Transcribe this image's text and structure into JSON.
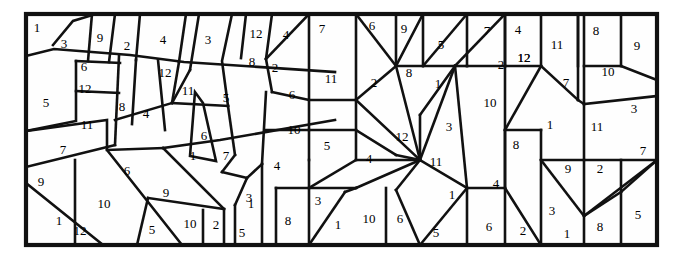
{
  "figure": {
    "name": "numbered-polygon-dissection",
    "background_color": "#ffffff",
    "line_color": "#111111",
    "fill_color": "#fefefe",
    "border": {
      "x": 26,
      "y": 14,
      "width": 631,
      "height": 231
    }
  },
  "cells": [
    {
      "id": "c01",
      "label": "1",
      "x": 37,
      "y": 29
    },
    {
      "id": "c02",
      "label": "3",
      "x": 64,
      "y": 45
    },
    {
      "id": "c03",
      "label": "9",
      "x": 100,
      "y": 39
    },
    {
      "id": "c04",
      "label": "2",
      "x": 127,
      "y": 47
    },
    {
      "id": "c05",
      "label": "4",
      "x": 163,
      "y": 41
    },
    {
      "id": "c06",
      "label": "3",
      "x": 208,
      "y": 41
    },
    {
      "id": "c07",
      "label": "12",
      "x": 256,
      "y": 35
    },
    {
      "id": "c08",
      "label": "4",
      "x": 286,
      "y": 36
    },
    {
      "id": "c09",
      "label": "7",
      "x": 322,
      "y": 30
    },
    {
      "id": "c10",
      "label": "6",
      "x": 372,
      "y": 27
    },
    {
      "id": "c11",
      "label": "9",
      "x": 404,
      "y": 30
    },
    {
      "id": "c12",
      "label": "5",
      "x": 441,
      "y": 46
    },
    {
      "id": "c13",
      "label": "7",
      "x": 487,
      "y": 32
    },
    {
      "id": "c14",
      "label": "4",
      "x": 518,
      "y": 31
    },
    {
      "id": "c15",
      "label": "12",
      "x": 524,
      "y": 59
    },
    {
      "id": "c16",
      "label": "11",
      "x": 557,
      "y": 46
    },
    {
      "id": "c17",
      "label": "8",
      "x": 596,
      "y": 32
    },
    {
      "id": "c18",
      "label": "9",
      "x": 637,
      "y": 47
    },
    {
      "id": "c19",
      "label": "6",
      "x": 84,
      "y": 68
    },
    {
      "id": "c20",
      "label": "12",
      "x": 165,
      "y": 74
    },
    {
      "id": "c21",
      "label": "8",
      "x": 252,
      "y": 63
    },
    {
      "id": "c22",
      "label": "2",
      "x": 275,
      "y": 69
    },
    {
      "id": "c23",
      "label": "11",
      "x": 331,
      "y": 80
    },
    {
      "id": "c24",
      "label": "2",
      "x": 374,
      "y": 84
    },
    {
      "id": "c25",
      "label": "8",
      "x": 409,
      "y": 74
    },
    {
      "id": "c26",
      "label": "1",
      "x": 438,
      "y": 85
    },
    {
      "id": "c27",
      "label": "2",
      "x": 501,
      "y": 66
    },
    {
      "id": "c28",
      "label": "12",
      "x": 524,
      "y": 59
    },
    {
      "id": "c29",
      "label": "7",
      "x": 566,
      "y": 84
    },
    {
      "id": "c30",
      "label": "10",
      "x": 608,
      "y": 73
    },
    {
      "id": "c31",
      "label": "12",
      "x": 85,
      "y": 90
    },
    {
      "id": "c32",
      "label": "5",
      "x": 46,
      "y": 104
    },
    {
      "id": "c33",
      "label": "8",
      "x": 122,
      "y": 108
    },
    {
      "id": "c34",
      "label": "4",
      "x": 146,
      "y": 115
    },
    {
      "id": "c35",
      "label": "11",
      "x": 188,
      "y": 92
    },
    {
      "id": "c36",
      "label": "5",
      "x": 226,
      "y": 99
    },
    {
      "id": "c37",
      "label": "6",
      "x": 292,
      "y": 96
    },
    {
      "id": "c38",
      "label": "10",
      "x": 490,
      "y": 104
    },
    {
      "id": "c39",
      "label": "3",
      "x": 634,
      "y": 110
    },
    {
      "id": "c40",
      "label": "11",
      "x": 87,
      "y": 126
    },
    {
      "id": "c41",
      "label": "6",
      "x": 204,
      "y": 137
    },
    {
      "id": "c42",
      "label": "10",
      "x": 294,
      "y": 131
    },
    {
      "id": "c43",
      "label": "5",
      "x": 327,
      "y": 147
    },
    {
      "id": "c44",
      "label": "12",
      "x": 402,
      "y": 138
    },
    {
      "id": "c45",
      "label": "3",
      "x": 449,
      "y": 128
    },
    {
      "id": "c46",
      "label": "1",
      "x": 550,
      "y": 126
    },
    {
      "id": "c47",
      "label": "8",
      "x": 516,
      "y": 146
    },
    {
      "id": "c48",
      "label": "11",
      "x": 597,
      "y": 128
    },
    {
      "id": "c49",
      "label": "7",
      "x": 643,
      "y": 152
    },
    {
      "id": "c50",
      "label": "7",
      "x": 63,
      "y": 151
    },
    {
      "id": "c51",
      "label": "1",
      "x": 193,
      "y": 157
    },
    {
      "id": "c52",
      "label": "7",
      "x": 226,
      "y": 157
    },
    {
      "id": "c53",
      "label": "4",
      "x": 277,
      "y": 167
    },
    {
      "id": "c54",
      "label": "4",
      "x": 369,
      "y": 160
    },
    {
      "id": "c55",
      "label": "11",
      "x": 436,
      "y": 163
    },
    {
      "id": "c56",
      "label": "9",
      "x": 568,
      "y": 170
    },
    {
      "id": "c57",
      "label": "2",
      "x": 600,
      "y": 170
    },
    {
      "id": "c58",
      "label": "9",
      "x": 41,
      "y": 183
    },
    {
      "id": "c59",
      "label": "6",
      "x": 127,
      "y": 172
    },
    {
      "id": "c60",
      "label": "9",
      "x": 166,
      "y": 194
    },
    {
      "id": "c61",
      "label": "3",
      "x": 249,
      "y": 199
    },
    {
      "id": "c62",
      "label": "1",
      "x": 452,
      "y": 196
    },
    {
      "id": "c63",
      "label": "4",
      "x": 496,
      "y": 185
    },
    {
      "id": "c64",
      "label": "1",
      "x": 59,
      "y": 222
    },
    {
      "id": "c65",
      "label": "10",
      "x": 104,
      "y": 205
    },
    {
      "id": "c66",
      "label": "12",
      "x": 80,
      "y": 232
    },
    {
      "id": "c67",
      "label": "5",
      "x": 152,
      "y": 231
    },
    {
      "id": "c68",
      "label": "10",
      "x": 190,
      "y": 225
    },
    {
      "id": "c69",
      "label": "2",
      "x": 216,
      "y": 226
    },
    {
      "id": "c70",
      "label": "1",
      "x": 251,
      "y": 205
    },
    {
      "id": "c71",
      "label": "5",
      "x": 242,
      "y": 234
    },
    {
      "id": "c72",
      "label": "8",
      "x": 288,
      "y": 222
    },
    {
      "id": "c73",
      "label": "3",
      "x": 318,
      "y": 202
    },
    {
      "id": "c74",
      "label": "1",
      "x": 338,
      "y": 226
    },
    {
      "id": "c75",
      "label": "10",
      "x": 369,
      "y": 220
    },
    {
      "id": "c76",
      "label": "6",
      "x": 400,
      "y": 220
    },
    {
      "id": "c77",
      "label": "5",
      "x": 436,
      "y": 234
    },
    {
      "id": "c78",
      "label": "6",
      "x": 489,
      "y": 228
    },
    {
      "id": "c79",
      "label": "2",
      "x": 523,
      "y": 232
    },
    {
      "id": "c80",
      "label": "3",
      "x": 552,
      "y": 212
    },
    {
      "id": "c81",
      "label": "1",
      "x": 567,
      "y": 235
    },
    {
      "id": "c82",
      "label": "8",
      "x": 600,
      "y": 228
    },
    {
      "id": "c83",
      "label": "5",
      "x": 638,
      "y": 216
    }
  ],
  "edges": [
    "M26,14 L657,14 L657,245 L26,245 Z",
    "M26,56 L54,49 L130,55 L184,62 L335,72",
    "M53,45 L73,21 L96,14",
    "M115,14 L109,62",
    "M92,14 L88,61",
    "M76,61 L76,121 L26,131",
    "M76,61 L120,63",
    "M76,91 L119,93",
    "M119,56 L115,145",
    "M140,14 L136,60",
    "M136,60 L132,124",
    "M165,130 L158,60",
    "M186,14 L179,62",
    "M179,62 L172,103",
    "M199,14 L190,70",
    "M232,14 L222,61 L228,106",
    "M246,14 L241,58",
    "M272,14 L266,59",
    "M266,59 L272,92",
    "M309,14 L266,59",
    "M309,14 L309,160",
    "M309,14 L356,14",
    "M356,14 L356,100",
    "M356,14 L396,66",
    "M396,14 L396,66",
    "M396,66 L455,66",
    "M423,14 L396,66",
    "M423,14 L423,66",
    "M467,14 L467,66",
    "M467,14 L423,66",
    "M505,14 L505,66",
    "M541,14 L541,66",
    "M541,14 L578,14",
    "M578,14 L578,100",
    "M578,14 L578,66",
    "M584,14 L584,104",
    "M621,14 L621,66",
    "M621,66 L657,80",
    "M584,66 L621,66",
    "M584,104 L657,96",
    "M115,120 L172,103",
    "M172,103 L228,106",
    "M190,70 L172,103",
    "M195,92 L190,156 L216,161 L203,103 Z",
    "M228,106 L235,155",
    "M235,155 L222,172",
    "M222,172 L247,178",
    "M266,92 L262,164",
    "M272,92 L309,100",
    "M309,100 L356,100",
    "M356,100 L356,160",
    "M266,130 L309,130",
    "M309,130 L356,130",
    "M26,131 L107,120 L107,150 L163,148",
    "M163,148 L220,140 L335,120",
    "M26,167 L115,145",
    "M26,183 L103,245",
    "M75,160 L75,245",
    "M107,150 L182,245",
    "M163,148 L224,209",
    "M148,198 L224,209",
    "M148,198 L137,245",
    "M224,209 L224,245",
    "M203,210 L203,245",
    "M235,205 L235,245",
    "M247,178 L235,205",
    "M262,164 L262,245",
    "M262,164 L247,178",
    "M276,188 L276,245",
    "M276,188 L309,188",
    "M309,160 L309,245",
    "M309,188 L356,188",
    "M356,160 L309,188",
    "M309,245 L345,192",
    "M345,192 L356,188",
    "M356,100 L396,66",
    "M356,100 L420,160",
    "M356,130 L396,155",
    "M396,66 L420,160",
    "M396,155 L420,160",
    "M420,160 L396,190",
    "M396,190 L420,245",
    "M356,160 L420,160",
    "M356,188 L420,160",
    "M386,245 L386,188",
    "M420,160 L455,66",
    "M420,160 L467,188",
    "M420,245 L467,188",
    "M455,66 L467,188",
    "M455,66 L505,14",
    "M455,66 L467,66",
    "M467,188 L467,245",
    "M467,188 L505,188",
    "M455,66 L420,115",
    "M420,115 L420,160",
    "M467,66 L505,66",
    "M505,66 L541,66",
    "M505,66 L505,188",
    "M505,14 L505,66",
    "M541,66 L505,130",
    "M505,130 L541,130",
    "M541,66 L578,100",
    "M578,100 L584,104",
    "M541,130 L541,245",
    "M505,130 L505,245",
    "M541,160 L584,160",
    "M584,104 L584,245",
    "M541,160 L584,216",
    "M584,216 L657,160",
    "M584,160 L657,160",
    "M621,160 L621,245",
    "M657,160 L621,192",
    "M621,192 L584,216",
    "M505,188 L541,245"
  ]
}
